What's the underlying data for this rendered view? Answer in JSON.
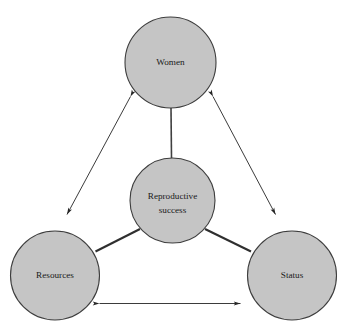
{
  "diagram": {
    "type": "node-link-triangle",
    "background_color": "#ffffff",
    "node_fill_color": "#c5c5c5",
    "node_stroke_color": "#3d3d3d",
    "line_color": "#2f2f2f",
    "arrow_color": "#303030",
    "nodes": [
      {
        "id": "women",
        "label": "Women",
        "label_lines": [
          "Women"
        ],
        "cx": 170.5,
        "cy": 62.5,
        "r": 45.5,
        "position": "top"
      },
      {
        "id": "reproductive-success",
        "label": "Reproductive success",
        "label_lines": [
          "Reproductive",
          "success"
        ],
        "cx": 172.5,
        "cy": 200.5,
        "r": 42.5,
        "position": "center"
      },
      {
        "id": "resources",
        "label": "Resources",
        "label_lines": [
          "Resources"
        ],
        "cx": 55,
        "cy": 275.5,
        "r": 44.5,
        "position": "bottom-left"
      },
      {
        "id": "status",
        "label": "Status",
        "label_lines": [
          "Status"
        ],
        "cx": 292,
        "cy": 275.5,
        "r": 44.5,
        "position": "bottom-right"
      }
    ],
    "spokes": [
      {
        "id": "spoke-women-reproductive",
        "from": "reproductive-success",
        "to": "women",
        "style": "plain-line",
        "arrowheads": "none"
      },
      {
        "id": "spoke-reproductive-resources",
        "from": "reproductive-success",
        "to": "resources",
        "style": "plain-line",
        "arrowheads": "none"
      },
      {
        "id": "spoke-reproductive-status",
        "from": "reproductive-success",
        "to": "status",
        "style": "plain-line",
        "arrowheads": "none"
      }
    ],
    "relations": [
      {
        "id": "arrow-women-resources",
        "from": "women",
        "to": "resources",
        "style": "double-headed-arrow",
        "arrowheads": "both"
      },
      {
        "id": "arrow-women-status",
        "from": "women",
        "to": "status",
        "style": "double-headed-arrow",
        "arrowheads": "both"
      },
      {
        "id": "arrow-resources-status",
        "from": "resources",
        "to": "status",
        "style": "double-headed-arrow",
        "arrowheads": "both"
      }
    ]
  }
}
